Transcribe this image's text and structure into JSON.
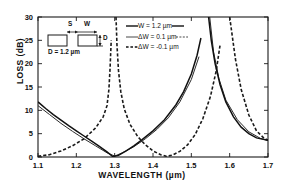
{
  "chart_data": {
    "type": "line",
    "title": "",
    "xlabel": "WAVELENGTH (µm)",
    "ylabel": "LOSS (dB)",
    "xlim": [
      1.1,
      1.7
    ],
    "ylim": [
      0,
      30
    ],
    "xticks": [
      "1.1",
      "1.2",
      "1.3",
      "1.4",
      "1.5",
      "1.6",
      "1.7"
    ],
    "yticks": [
      "0",
      "5",
      "10",
      "15",
      "20",
      "25",
      "30"
    ],
    "grid": false,
    "legend_position": "top-right-inside",
    "series": [
      {
        "name": "W = 1.2 µm",
        "style": "solid",
        "poles": [
          1.287,
          1.535
        ],
        "zeros": [
          1.292,
          1.41
        ],
        "points": [
          {
            "x": 1.1,
            "y": 11.8
          },
          {
            "x": 1.12,
            "y": 10.4
          },
          {
            "x": 1.14,
            "y": 9.1
          },
          {
            "x": 1.16,
            "y": 7.9
          },
          {
            "x": 1.18,
            "y": 6.7
          },
          {
            "x": 1.2,
            "y": 5.6
          },
          {
            "x": 1.22,
            "y": 4.5
          },
          {
            "x": 1.24,
            "y": 3.4
          },
          {
            "x": 1.26,
            "y": 2.3
          },
          {
            "x": 1.28,
            "y": 1.1
          },
          {
            "x": 1.295,
            "y": 0.1
          },
          {
            "x": 1.31,
            "y": 0.35
          },
          {
            "x": 1.33,
            "y": 1.3
          },
          {
            "x": 1.35,
            "y": 2.4
          },
          {
            "x": 1.37,
            "y": 3.6
          },
          {
            "x": 1.4,
            "y": 5.6
          },
          {
            "x": 1.43,
            "y": 8.0
          },
          {
            "x": 1.46,
            "y": 11.2
          },
          {
            "x": 1.48,
            "y": 14.0
          },
          {
            "x": 1.5,
            "y": 17.8
          },
          {
            "x": 1.515,
            "y": 21.8
          },
          {
            "x": 1.525,
            "y": 25.5
          },
          {
            "x": 1.532,
            "y": 30.0
          },
          {
            "x": 1.545,
            "y": 30.0
          },
          {
            "x": 1.552,
            "y": 25.0
          },
          {
            "x": 1.562,
            "y": 20.0
          },
          {
            "x": 1.575,
            "y": 15.5
          },
          {
            "x": 1.59,
            "y": 11.8
          },
          {
            "x": 1.61,
            "y": 8.6
          },
          {
            "x": 1.63,
            "y": 6.4
          },
          {
            "x": 1.65,
            "y": 5.0
          },
          {
            "x": 1.67,
            "y": 4.1
          },
          {
            "x": 1.7,
            "y": 3.6
          }
        ]
      },
      {
        "name": "ΔW = 0.1 µm",
        "style": "solid-thin",
        "poles": [
          1.283,
          1.538
        ],
        "points": [
          {
            "x": 1.1,
            "y": 11.0
          },
          {
            "x": 1.13,
            "y": 9.1
          },
          {
            "x": 1.16,
            "y": 7.2
          },
          {
            "x": 1.19,
            "y": 5.5
          },
          {
            "x": 1.22,
            "y": 3.9
          },
          {
            "x": 1.25,
            "y": 2.4
          },
          {
            "x": 1.28,
            "y": 0.9
          },
          {
            "x": 1.3,
            "y": 0.2
          },
          {
            "x": 1.32,
            "y": 0.9
          },
          {
            "x": 1.35,
            "y": 2.2
          },
          {
            "x": 1.38,
            "y": 3.9
          },
          {
            "x": 1.41,
            "y": 5.9
          },
          {
            "x": 1.44,
            "y": 8.4
          },
          {
            "x": 1.47,
            "y": 11.8
          },
          {
            "x": 1.5,
            "y": 16.6
          },
          {
            "x": 1.52,
            "y": 21.5
          },
          {
            "x": 1.535,
            "y": 30.0
          },
          {
            "x": 1.548,
            "y": 30.0
          },
          {
            "x": 1.558,
            "y": 22.5
          },
          {
            "x": 1.572,
            "y": 16.8
          },
          {
            "x": 1.59,
            "y": 12.2
          },
          {
            "x": 1.62,
            "y": 8.0
          },
          {
            "x": 1.65,
            "y": 5.4
          },
          {
            "x": 1.68,
            "y": 4.0
          },
          {
            "x": 1.7,
            "y": 3.5
          }
        ]
      },
      {
        "name": "ΔW = -0.1 µm",
        "style": "dashed",
        "poles": [
          1.292,
          1.532
        ],
        "points": [
          {
            "x": 1.1,
            "y": 0.15
          },
          {
            "x": 1.13,
            "y": 0.5
          },
          {
            "x": 1.16,
            "y": 1.3
          },
          {
            "x": 1.19,
            "y": 2.4
          },
          {
            "x": 1.22,
            "y": 3.9
          },
          {
            "x": 1.25,
            "y": 6.2
          },
          {
            "x": 1.27,
            "y": 8.6
          },
          {
            "x": 1.28,
            "y": 11.0
          },
          {
            "x": 1.285,
            "y": 14.5
          },
          {
            "x": 1.288,
            "y": 19.0
          },
          {
            "x": 1.291,
            "y": 25.0
          },
          {
            "x": 1.2935,
            "y": 30.0
          },
          {
            "x": 1.3035,
            "y": 30.0
          },
          {
            "x": 1.306,
            "y": 24.0
          },
          {
            "x": 1.31,
            "y": 18.5
          },
          {
            "x": 1.316,
            "y": 14.0
          },
          {
            "x": 1.325,
            "y": 10.3
          },
          {
            "x": 1.34,
            "y": 7.0
          },
          {
            "x": 1.36,
            "y": 4.4
          },
          {
            "x": 1.38,
            "y": 2.6
          },
          {
            "x": 1.4,
            "y": 1.3
          },
          {
            "x": 1.42,
            "y": 0.5
          },
          {
            "x": 1.435,
            "y": 0.15
          },
          {
            "x": 1.45,
            "y": 0.4
          },
          {
            "x": 1.47,
            "y": 1.2
          },
          {
            "x": 1.49,
            "y": 2.6
          },
          {
            "x": 1.51,
            "y": 4.8
          },
          {
            "x": 1.53,
            "y": 8.2
          },
          {
            "x": 1.55,
            "y": 13.0
          },
          {
            "x": 1.565,
            "y": 18.5
          },
          {
            "x": 1.575,
            "y": 24.0
          },
          {
            "x": 1.583,
            "y": 30.0
          },
          {
            "x": 1.6,
            "y": 30.0
          },
          {
            "x": 1.615,
            "y": 21.0
          },
          {
            "x": 1.63,
            "y": 14.5
          },
          {
            "x": 1.65,
            "y": 9.0
          },
          {
            "x": 1.67,
            "y": 5.6
          },
          {
            "x": 1.69,
            "y": 4.0
          },
          {
            "x": 1.7,
            "y": 3.6
          }
        ]
      }
    ],
    "legend": [
      {
        "label": "W = 1.2 µm",
        "style": "solid"
      },
      {
        "label": "ΔW = 0.1 µm",
        "style": "solid-thin"
      },
      {
        "label": "ΔW = -0.1 µm",
        "style": "dashed"
      }
    ],
    "inset": {
      "s_label": "S",
      "w_label": "W",
      "d_label": "D",
      "caption": "D = 1.2 µm"
    },
    "colors": {
      "axis": "#1a1a1a",
      "curve": "#1a1a1a",
      "background": "#ffffff"
    }
  }
}
